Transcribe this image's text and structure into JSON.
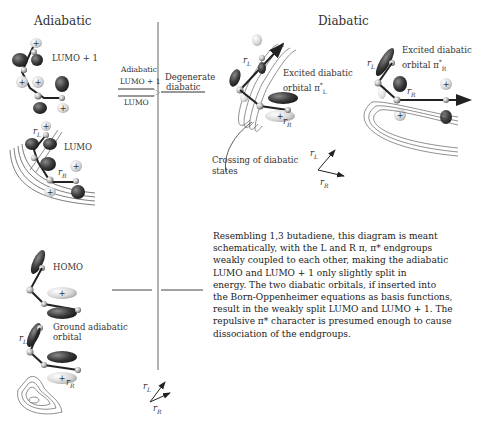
{
  "headings": {
    "left": "Adiabatic",
    "right": "Diabatic"
  },
  "left_panel": {
    "lumo_plus_1_label": "LUMO + 1",
    "lumo_label": "LUMO",
    "homo_label": "HOMO",
    "ground_label_line1": "Ground adiabatic",
    "ground_label_line2": "orbital",
    "rL": "r",
    "rL_sub": "L",
    "rR": "r",
    "rR_sub": "R"
  },
  "energy_levels": {
    "adiabatic_label": "Adiabatic",
    "lumo_plus_1": "LUMO + 1",
    "lumo": "LUMO",
    "degenerate_line1": "Degenerate",
    "degenerate_line2": "diabatic"
  },
  "right_panel": {
    "excited_L_line1": "Excited diabatic",
    "excited_L_line2": "orbital π",
    "excited_L_sup": "*",
    "excited_L_sub": "L",
    "excited_R_line1": "Excited diabatic",
    "excited_R_line2": "orbital π",
    "excited_R_sup": "*",
    "excited_R_sub": "R",
    "crossing_line1": "Crossing of  diabatic",
    "crossing_line2": "states",
    "rL": "r",
    "rL_sub": "L",
    "rR": "r",
    "rR_sub": "R"
  },
  "axes": {
    "rL": "r",
    "rL_sub": "L",
    "rR": "r",
    "rR_sub": "R"
  },
  "description": {
    "lines": [
      "Resembling 1,3 butadiene, this diagram is meant",
      "schematically, with the L and R π, π* endgroups",
      "weakly coupled to each other, making the adiabatic",
      "LUMO and LUMO + 1 only slightly split in",
      "energy.  The two diabatic orbitals, if inserted into",
      "the Born-Oppenheimer equations as basis functions,",
      "result in the weakly split LUMO and LUMO + 1. The",
      "repulsive π* character is presumed  enough to cause",
      "dissociation of the endgroups."
    ]
  },
  "colors": {
    "lobe_dark": "#3a3a3a",
    "lobe_light": "#d8d8d8",
    "line": "#222222",
    "divider": "#555555"
  }
}
